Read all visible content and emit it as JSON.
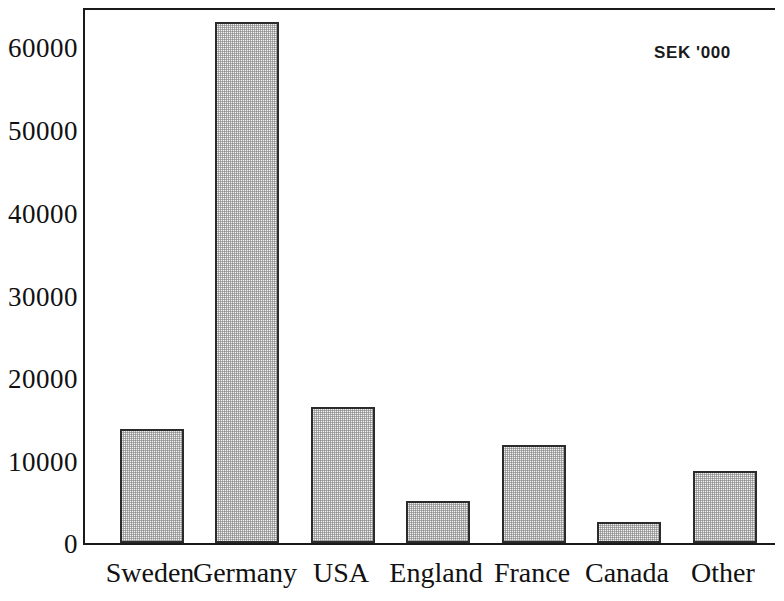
{
  "chart_data": {
    "type": "bar",
    "title": "",
    "subtitle": "",
    "annotation": "SEK '000",
    "xlabel": "",
    "ylabel": "",
    "categories": [
      "Sweden",
      "Germany",
      "USA",
      "England",
      "France",
      "Canada",
      "Other"
    ],
    "values": [
      13800,
      63000,
      16500,
      5100,
      11800,
      2500,
      8700
    ],
    "series": [
      {
        "name": "Sales by country",
        "values": [
          13800,
          63000,
          16500,
          5100,
          11800,
          2500,
          8700
        ]
      }
    ],
    "ylim": [
      0,
      64500
    ],
    "ytick_values": [
      0,
      10000,
      20000,
      30000,
      40000,
      50000,
      60000
    ],
    "ytick_labels": [
      "0",
      "10000",
      "20000",
      "30000",
      "40000",
      "50000",
      "60000"
    ],
    "grid": false,
    "legend": null,
    "legend_position": "none",
    "bar_fill_color": "#f0f0f0",
    "bar_edge_color": "#2b2b2b",
    "axis_color": "#1a1a1a",
    "background_color": "#ffffff"
  }
}
